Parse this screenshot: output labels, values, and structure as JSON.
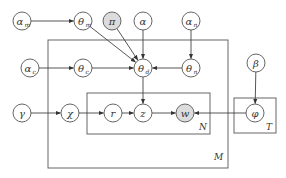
{
  "diagram": {
    "type": "plate-notation-graphical-model",
    "nodes": [
      {
        "id": "alpha_m",
        "label": "α",
        "sub": "m",
        "x": 22,
        "y": 21,
        "observed": false
      },
      {
        "id": "theta_m",
        "label": "θ",
        "sub": "m",
        "x": 83,
        "y": 21,
        "observed": false
      },
      {
        "id": "pi",
        "label": "π",
        "sub": "",
        "x": 112,
        "y": 21,
        "observed": true
      },
      {
        "id": "alpha",
        "label": "α",
        "sub": "",
        "x": 143,
        "y": 21,
        "observed": false
      },
      {
        "id": "alpha_n",
        "label": "α",
        "sub": "n",
        "x": 191,
        "y": 21,
        "observed": false
      },
      {
        "id": "alpha_c",
        "label": "α",
        "sub": "c",
        "x": 30,
        "y": 68,
        "observed": false
      },
      {
        "id": "theta_c",
        "label": "θ",
        "sub": "c",
        "x": 83,
        "y": 68,
        "observed": false
      },
      {
        "id": "theta_d",
        "label": "θ",
        "sub": "d",
        "x": 143,
        "y": 68,
        "observed": false
      },
      {
        "id": "theta_n",
        "label": "θ",
        "sub": "n",
        "x": 191,
        "y": 68,
        "observed": false
      },
      {
        "id": "beta",
        "label": "β",
        "sub": "",
        "x": 256,
        "y": 63,
        "observed": false
      },
      {
        "id": "gamma",
        "label": "γ",
        "sub": "",
        "x": 22,
        "y": 113,
        "observed": false
      },
      {
        "id": "chi",
        "label": "χ",
        "sub": "",
        "x": 70,
        "y": 113,
        "observed": false
      },
      {
        "id": "r",
        "label": "r",
        "sub": "",
        "x": 113,
        "y": 113,
        "observed": false
      },
      {
        "id": "z",
        "label": "z",
        "sub": "",
        "x": 143,
        "y": 113,
        "observed": false
      },
      {
        "id": "w",
        "label": "w",
        "sub": "",
        "x": 185,
        "y": 113,
        "observed": true
      },
      {
        "id": "phi",
        "label": "φ",
        "sub": "",
        "x": 255,
        "y": 113,
        "observed": false
      }
    ],
    "edges": [
      {
        "from": "alpha_m",
        "to": "theta_m"
      },
      {
        "from": "theta_m",
        "to": "theta_d"
      },
      {
        "from": "pi",
        "to": "theta_d"
      },
      {
        "from": "alpha",
        "to": "theta_d"
      },
      {
        "from": "alpha_n",
        "to": "theta_n"
      },
      {
        "from": "alpha_c",
        "to": "theta_c"
      },
      {
        "from": "theta_c",
        "to": "theta_d"
      },
      {
        "from": "theta_n",
        "to": "theta_d"
      },
      {
        "from": "theta_d",
        "to": "z"
      },
      {
        "from": "gamma",
        "to": "chi"
      },
      {
        "from": "chi",
        "to": "r"
      },
      {
        "from": "r",
        "to": "z"
      },
      {
        "from": "z",
        "to": "w"
      },
      {
        "from": "phi",
        "to": "w"
      },
      {
        "from": "beta",
        "to": "phi"
      }
    ],
    "plates": [
      {
        "id": "M",
        "label": "M",
        "x": 48,
        "y": 40,
        "w": 180,
        "h": 128,
        "label_x": 214,
        "label_y": 160
      },
      {
        "id": "N",
        "label": "N",
        "x": 87,
        "y": 93,
        "w": 123,
        "h": 41,
        "label_x": 199,
        "label_y": 130
      },
      {
        "id": "T",
        "label": "T",
        "x": 234,
        "y": 98,
        "w": 42,
        "h": 35,
        "label_x": 266,
        "label_y": 130
      }
    ]
  },
  "colors": {
    "observed_fill": "#dcdcdc",
    "node_stroke": "#555555",
    "plate_stroke": "#666666",
    "edge": "#444444"
  }
}
